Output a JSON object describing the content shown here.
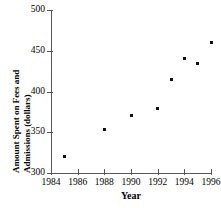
{
  "chart_data": {
    "type": "scatter",
    "title": "",
    "xlabel": "Year",
    "ylabel": "Amount Spent on Fees and Admissions (dollars)",
    "ylabel_lines": [
      "Amount Spent on Fees and",
      "Admissions (dollars)"
    ],
    "x": [
      1985,
      1988,
      1990,
      1992,
      1993,
      1994,
      1995,
      1996
    ],
    "values": [
      320,
      353,
      371,
      379,
      415,
      440,
      434,
      460
    ],
    "points": [
      {
        "x": 1985,
        "y": 320
      },
      {
        "x": 1988,
        "y": 353
      },
      {
        "x": 1990,
        "y": 371
      },
      {
        "x": 1992,
        "y": 379
      },
      {
        "x": 1993,
        "y": 415
      },
      {
        "x": 1994,
        "y": 440
      },
      {
        "x": 1995,
        "y": 434
      },
      {
        "x": 1996,
        "y": 460
      }
    ],
    "xlim": [
      1984,
      1996
    ],
    "ylim": [
      300,
      500
    ],
    "xticks": [
      1984,
      1986,
      1988,
      1990,
      1992,
      1994,
      1996
    ],
    "xtick_labels": [
      "1984",
      "1986",
      "1988",
      "1990",
      "1992",
      "1994",
      "1996"
    ],
    "yticks": [
      300,
      350,
      400,
      450,
      500
    ],
    "ytick_labels": [
      "500",
      "450",
      "400",
      "350",
      "300"
    ],
    "grid": false,
    "legend": null,
    "marker_color": "#111111",
    "axis_color": "#555555"
  }
}
